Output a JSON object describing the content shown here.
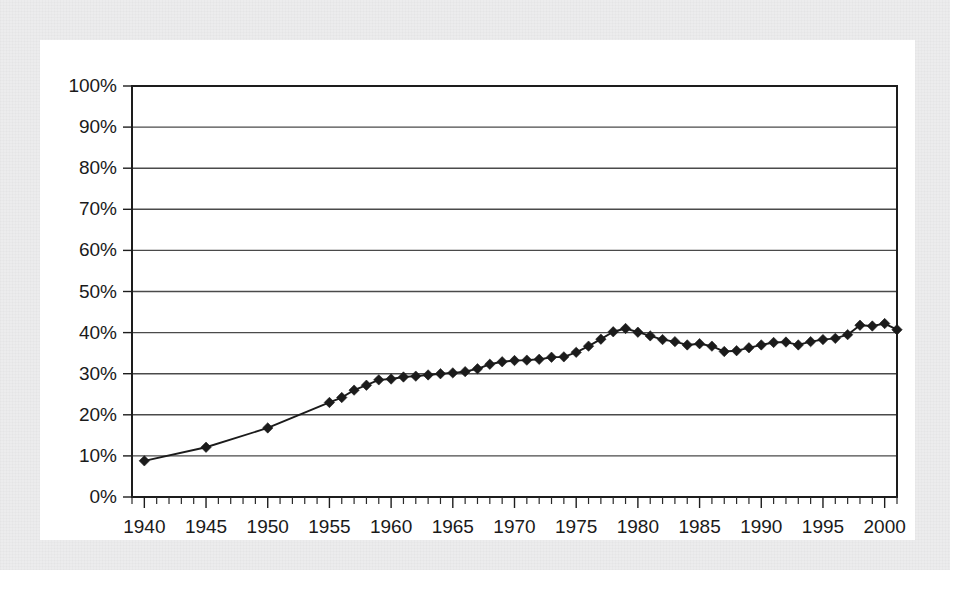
{
  "figure": {
    "background_color": "#ececed",
    "card_color": "#ffffff",
    "ink_color": "#1b1b1b",
    "grid_color": "#4a4a4a"
  },
  "chart_data": {
    "type": "line",
    "title": "",
    "subtitle": "",
    "xlabel": "",
    "ylabel": "",
    "xlim": [
      1939,
      2001
    ],
    "ylim": [
      0,
      100
    ],
    "grid": "horizontal",
    "legend": "none",
    "marker": "diamond",
    "y_tick_labels": [
      "0%",
      "10%",
      "20%",
      "30%",
      "40%",
      "50%",
      "60%",
      "70%",
      "80%",
      "90%",
      "100%"
    ],
    "y_tick_values": [
      0,
      10,
      20,
      30,
      40,
      50,
      60,
      70,
      80,
      90,
      100
    ],
    "x_tick_labels": [
      "1940",
      "1945",
      "1950",
      "1955",
      "1960",
      "1965",
      "1970",
      "1975",
      "1980",
      "1985",
      "1990",
      "1995",
      "2000"
    ],
    "x_tick_values": [
      1940,
      1945,
      1950,
      1955,
      1960,
      1965,
      1970,
      1975,
      1980,
      1985,
      1990,
      1995,
      2000
    ],
    "x_minor_tick_step": 1,
    "series": [
      {
        "name": "percent",
        "x": [
          1940,
          1945,
          1950,
          1955,
          1956,
          1957,
          1958,
          1959,
          1960,
          1961,
          1962,
          1963,
          1964,
          1965,
          1966,
          1967,
          1968,
          1969,
          1970,
          1971,
          1972,
          1973,
          1974,
          1975,
          1976,
          1977,
          1978,
          1979,
          1980,
          1981,
          1982,
          1983,
          1984,
          1985,
          1986,
          1987,
          1988,
          1989,
          1990,
          1991,
          1992,
          1993,
          1994,
          1995,
          1996,
          1997,
          1998,
          1999,
          2000,
          2001
        ],
        "values": [
          8.8,
          12.1,
          16.8,
          23.0,
          24.2,
          26.0,
          27.2,
          28.5,
          28.7,
          29.2,
          29.4,
          29.7,
          30.0,
          30.2,
          30.5,
          31.2,
          32.3,
          32.9,
          33.2,
          33.3,
          33.5,
          34.0,
          34.1,
          35.2,
          36.7,
          38.4,
          40.2,
          41.0,
          40.1,
          39.2,
          38.3,
          37.8,
          37.0,
          37.3,
          36.7,
          35.4,
          35.6,
          36.3,
          37.0,
          37.6,
          37.7,
          37.0,
          37.8,
          38.3,
          38.6,
          39.5,
          41.8,
          41.6,
          42.2,
          40.7
        ]
      }
    ],
    "annotations": []
  }
}
